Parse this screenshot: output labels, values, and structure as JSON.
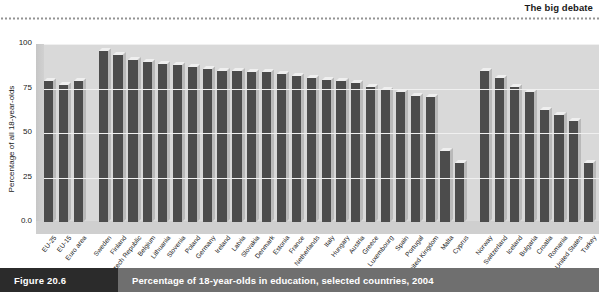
{
  "header": {
    "running_head": "The big debate"
  },
  "caption": {
    "figure_number": "Figure 20.6",
    "text": "Percentage of 18-year-olds in education, selected countries, 2004"
  },
  "chart_data": {
    "type": "bar",
    "title": "Percentage of 18-year-olds in education, selected countries, 2004",
    "xlabel": "",
    "ylabel": "Percentage of all 18-year-olds",
    "ylim": [
      0,
      100
    ],
    "yticks": [
      "0.0",
      "25",
      "50",
      "75",
      "100"
    ],
    "ytick_values": [
      0,
      25,
      50,
      75,
      100
    ],
    "grid": true,
    "legend": false,
    "style": "3d-column",
    "bar_color": "#4c4c4c",
    "panel_color": "#d9d9d9",
    "categories": [
      "EU-25",
      "EU-15",
      "Euro area",
      "Sweden",
      "Finland",
      "Czech Republic",
      "Belgium",
      "Lithuania",
      "Slovenia",
      "Poland",
      "Germany",
      "Ireland",
      "Latvia",
      "Slovakia",
      "Denmark",
      "Estonia",
      "France",
      "Netherlands",
      "Italy",
      "Hungary",
      "Austria",
      "Greece",
      "Luxembourg",
      "Spain",
      "Portugal",
      "United Kingdom",
      "Malta",
      "Cyprus",
      "Norway",
      "Switzerland",
      "Iceland",
      "Bulgaria",
      "Croatia",
      "Romania",
      "United States",
      "Turkey"
    ],
    "values": [
      79,
      77,
      79,
      96,
      94,
      91,
      90,
      89,
      88,
      87,
      86,
      85,
      85,
      84,
      84,
      83,
      82,
      81,
      80,
      79,
      78,
      76,
      74,
      73,
      71,
      70,
      40,
      33,
      85,
      81,
      76,
      73,
      63,
      60,
      57,
      33
    ],
    "groups": [
      {
        "name": "EU aggregates",
        "start": 0,
        "count": 3
      },
      {
        "name": "EU member states",
        "start": 3,
        "count": 25
      },
      {
        "name": "Other countries",
        "start": 28,
        "count": 8
      }
    ]
  }
}
